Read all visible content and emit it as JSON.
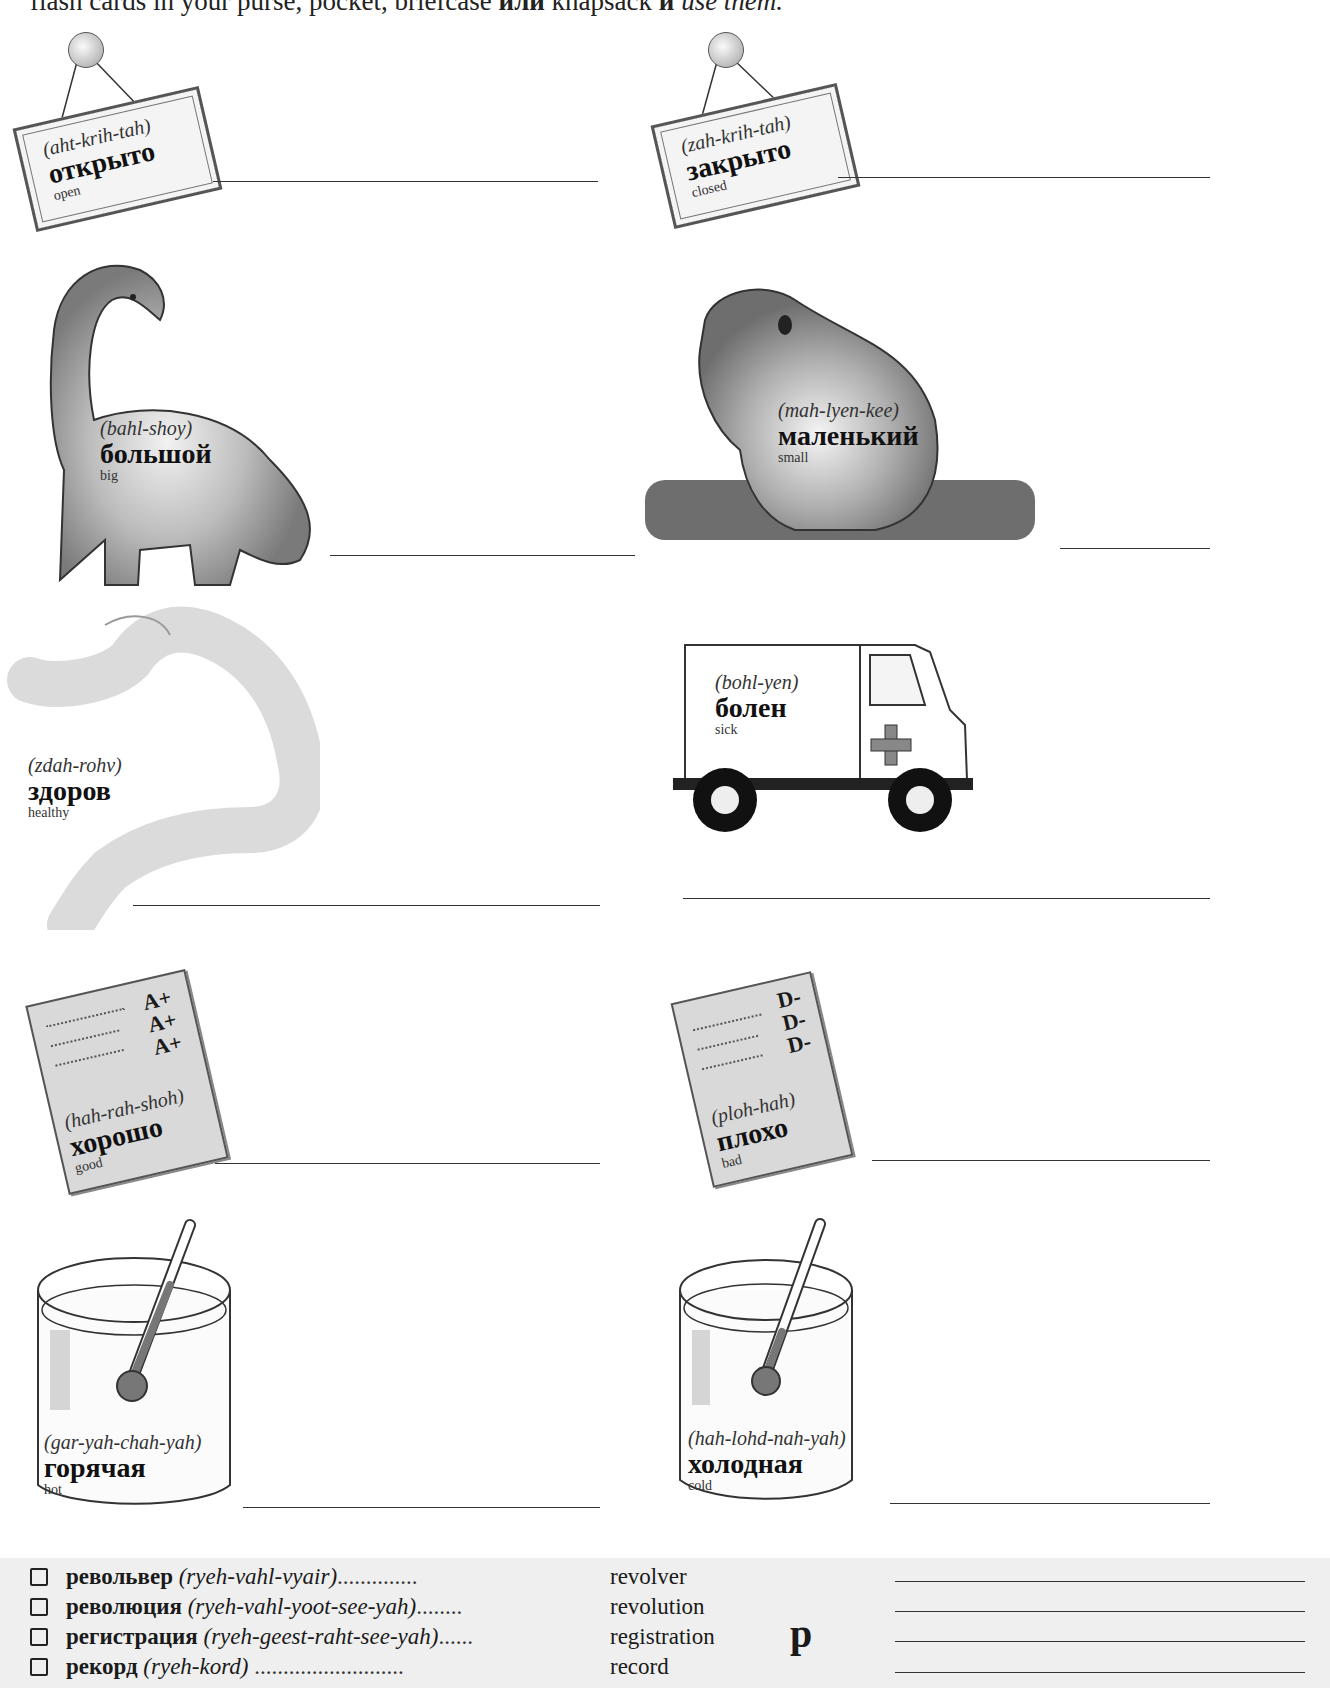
{
  "intro": {
    "text_before": "flash cards in your purse, pocket, briefcase ",
    "bold_word": "или",
    "text_middle": " knapsack ",
    "bold_word2": "и",
    "italic_end": " use them."
  },
  "cards": [
    {
      "id": "open",
      "pron": "(aht-krih-tah)",
      "ru": "открыто",
      "en": "open",
      "illustration": "hanging-sign"
    },
    {
      "id": "closed",
      "pron": "(zah-krih-tah)",
      "ru": "закрыто",
      "en": "closed",
      "illustration": "hanging-sign"
    },
    {
      "id": "big",
      "pron": "(bahl-shoy)",
      "ru": "большой",
      "en": "big",
      "illustration": "dinosaur"
    },
    {
      "id": "small",
      "pron": "(mah-lyen-kee)",
      "ru": "маленький",
      "en": "small",
      "illustration": "frog"
    },
    {
      "id": "healthy",
      "pron": "(zdah-rohv)",
      "ru": "здоров",
      "en": "healthy",
      "illustration": "flexed-arm"
    },
    {
      "id": "sick",
      "pron": "(bohl-yen)",
      "ru": "болен",
      "en": "sick",
      "illustration": "ambulance"
    },
    {
      "id": "good",
      "pron": "(hah-rah-shoh)",
      "ru": "хорошо",
      "en": "good",
      "illustration": "report-card",
      "grades": [
        "A+",
        "A+",
        "A+"
      ]
    },
    {
      "id": "bad",
      "pron": "(ploh-hah)",
      "ru": "плохо",
      "en": "bad",
      "illustration": "report-card",
      "grades": [
        "D-",
        "D-",
        "D-"
      ]
    },
    {
      "id": "hot",
      "pron": "(gar-yah-chah-yah)",
      "ru": "горячая",
      "en": "hot",
      "illustration": "glass-thermometer"
    },
    {
      "id": "cold",
      "pron": "(hah-lohd-nah-yah)",
      "ru": "холодная",
      "en": "cold",
      "illustration": "glass-thermometer"
    }
  ],
  "vocab": {
    "letter": "р",
    "items": [
      {
        "word": "револьвер",
        "pron": "(ryeh-vahl-vyair)",
        "dots": "..............",
        "meaning": "revolver"
      },
      {
        "word": "революция",
        "pron": "(ryeh-vahl-yoot-see-yah)",
        "dots": "........",
        "meaning": "revolution"
      },
      {
        "word": "регистрация",
        "pron": "(ryeh-geest-raht-see-yah)",
        "dots": "......",
        "meaning": "registration"
      },
      {
        "word": "рекорд",
        "pron": "(ryeh-kord)",
        "dots": "..........................",
        "meaning": "record"
      }
    ]
  }
}
